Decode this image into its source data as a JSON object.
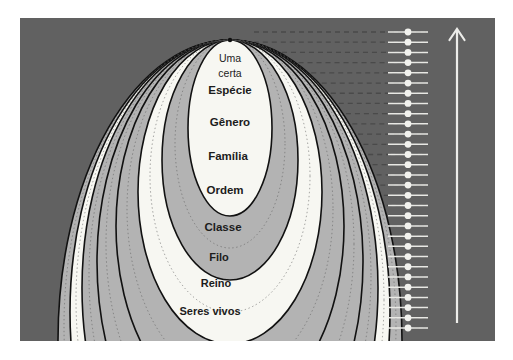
{
  "figure": {
    "type": "nested-ellipse-hierarchy",
    "language": "pt-BR",
    "panel_color": "#616161",
    "band_light": "#b3b3b3",
    "band_white": "#f7f7f2",
    "outline_color": "#111111",
    "dash_color": "#4a4a4a",
    "accent_white": "#f2f2ee",
    "arrow_color": "#ededea"
  },
  "labels": {
    "species_line1": "Uma",
    "species_line2": "certa",
    "species_line3": "Espécie",
    "genus": "Gênero",
    "family": "Família",
    "order": "Ordem",
    "class": "Classe",
    "phylum": "Filo",
    "kingdom": "Reino",
    "living": "Seres vivos"
  },
  "ranks": [
    {
      "key": "species",
      "label": "Espécie",
      "fill": "#f7f7f2"
    },
    {
      "key": "genus",
      "label": "Gênero",
      "fill": "#b3b3b3"
    },
    {
      "key": "family",
      "label": "Família",
      "fill": "#f7f7f2"
    },
    {
      "key": "order",
      "label": "Ordem",
      "fill": "#b3b3b3"
    },
    {
      "key": "class",
      "label": "Classe",
      "fill": "#b3b3b3"
    },
    {
      "key": "phylum",
      "label": "Filo",
      "fill": "#b3b3b3"
    },
    {
      "key": "kingdom",
      "label": "Reino",
      "fill": "#f7f7f2"
    },
    {
      "key": "living",
      "label": "Seres vivos",
      "fill": "#b3b3b3"
    }
  ],
  "scale": {
    "dot_count": 30,
    "dot_color": "#f2f2ee",
    "tick_color": "#e8e8e4",
    "arrow_direction": "up",
    "arrow_label": ""
  }
}
